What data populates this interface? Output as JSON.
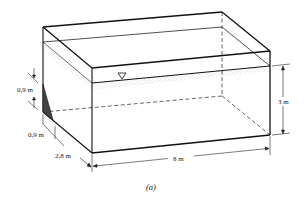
{
  "figure": {
    "caption": "(a)"
  },
  "dimensions": {
    "gate_upper": "0,9 m",
    "gate_lower": "0,9 m",
    "width": "2,8 m",
    "length": "8 m",
    "depth": "3 m"
  },
  "symbols": {
    "water_surface": "▽"
  },
  "colors": {
    "line": "#1a1a1a",
    "hatch": "#333333",
    "water_stipple": "#999999"
  }
}
